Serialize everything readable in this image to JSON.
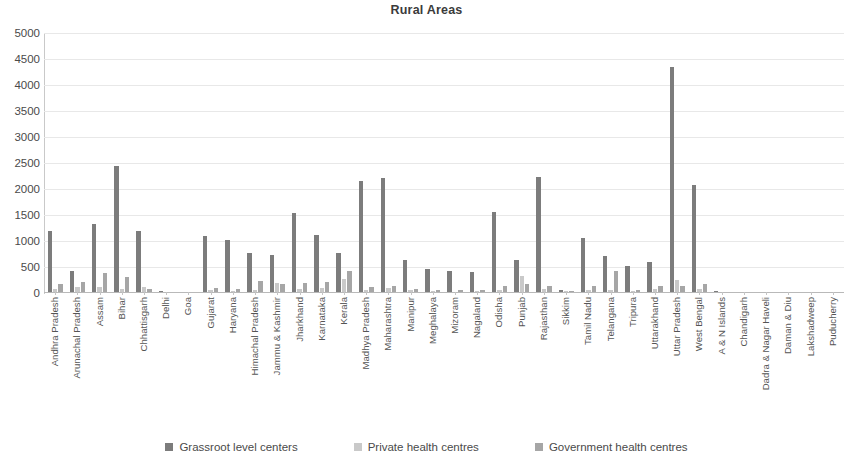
{
  "chart_data": {
    "type": "bar",
    "title": "Rural Areas",
    "xlabel": "",
    "ylabel": "",
    "ylim": [
      0,
      5000
    ],
    "ytick_step": 500,
    "yticks": [
      5000,
      4500,
      4000,
      3500,
      3000,
      2500,
      2000,
      1500,
      1000,
      500,
      0
    ],
    "grid": true,
    "legend_position": "bottom",
    "colors": {
      "grassroot": "#7c7c7c",
      "private": "#c9c9c9",
      "government": "#a6a6a6"
    },
    "categories": [
      "Andhra Pradesh",
      "Arunachal Pradesh",
      "Assam",
      "Bihar",
      "Chhattisgarh",
      "Delhi",
      "Goa",
      "Gujarat",
      "Haryana",
      "Himachal Pradesh",
      "Jammu & Kashmir",
      "Jharkhand",
      "Karnataka",
      "Kerala",
      "Madhya Pradesh",
      "Maharashtra",
      "Manipur",
      "Meghalaya",
      "Mizoram",
      "Nagaland",
      "Odisha",
      "Punjab",
      "Rajasthan",
      "Sikkim",
      "Tamil Nadu",
      "Telangana",
      "Tripura",
      "Uttarakhand",
      "Uttar Pradesh",
      "West Bengal",
      "A & N Islands",
      "Chandigarh",
      "Dadra & Nagar Haveli",
      "Daman & Diu",
      "Lakshadweep",
      "Puducherry"
    ],
    "series": [
      {
        "name": "Grassroot level centers",
        "color": "#7c7c7c",
        "values": [
          1200,
          420,
          1330,
          2450,
          1190,
          30,
          25,
          1100,
          1010,
          760,
          730,
          1540,
          1110,
          770,
          2160,
          2210,
          630,
          470,
          420,
          400,
          1550,
          630,
          2240,
          60,
          1050,
          720,
          520,
          590,
          4350,
          2070,
          30,
          20,
          15,
          12,
          10,
          25
        ]
      },
      {
        "name": "Private health centres",
        "color": "#c9c9c9",
        "values": [
          80,
          120,
          110,
          75,
          120,
          15,
          10,
          60,
          40,
          60,
          190,
          70,
          100,
          260,
          60,
          90,
          50,
          30,
          25,
          30,
          55,
          330,
          70,
          30,
          60,
          60,
          35,
          80,
          250,
          70,
          10,
          10,
          8,
          8,
          6,
          12
        ]
      },
      {
        "name": "Government health centres",
        "color": "#a6a6a6",
        "values": [
          170,
          220,
          390,
          310,
          70,
          20,
          15,
          90,
          70,
          230,
          180,
          200,
          220,
          420,
          110,
          140,
          80,
          60,
          50,
          50,
          130,
          180,
          140,
          40,
          130,
          420,
          60,
          130,
          130,
          180,
          15,
          12,
          10,
          10,
          8,
          15
        ]
      }
    ]
  },
  "legend": {
    "items": [
      {
        "label": "Grassroot level centers",
        "color": "#7c7c7c"
      },
      {
        "label": "Private health centres",
        "color": "#c9c9c9"
      },
      {
        "label": "Government health centres",
        "color": "#a6a6a6"
      }
    ]
  }
}
